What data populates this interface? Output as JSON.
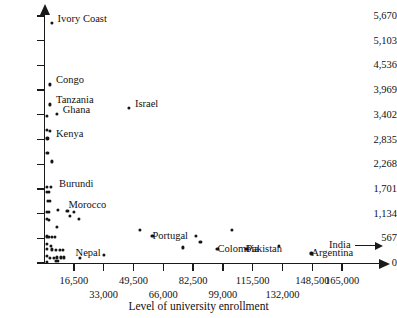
{
  "chart_data": {
    "type": "scatter",
    "title": "",
    "xlabel": "Level of university enrollment",
    "ylabel": "",
    "xlim": [
      0,
      181500
    ],
    "ylim": [
      0,
      5670
    ],
    "grid": false,
    "legend": null,
    "x_ticks": [
      {
        "value": 16500,
        "label": "16,500",
        "row": "a"
      },
      {
        "value": 33000,
        "label": "33,000",
        "row": "b"
      },
      {
        "value": 49500,
        "label": "49,500",
        "row": "a"
      },
      {
        "value": 66000,
        "label": "66,000",
        "row": "b"
      },
      {
        "value": 82500,
        "label": "82,500",
        "row": "a"
      },
      {
        "value": 99000,
        "label": "99,000",
        "row": "b"
      },
      {
        "value": 115500,
        "label": "115,500",
        "row": "a"
      },
      {
        "value": 132000,
        "label": "132,000",
        "row": "b"
      },
      {
        "value": 148500,
        "label": "148,500",
        "row": "a"
      },
      {
        "value": 165000,
        "label": "165,000",
        "row": "a"
      }
    ],
    "y_ticks": [
      {
        "value": 0,
        "label": "0"
      },
      {
        "value": 567,
        "label": "567"
      },
      {
        "value": 1134,
        "label": "1,134"
      },
      {
        "value": 1701,
        "label": "1,701"
      },
      {
        "value": 2268,
        "label": "2,268"
      },
      {
        "value": 2835,
        "label": "2,835"
      },
      {
        "value": 3402,
        "label": "3,402"
      },
      {
        "value": 3969,
        "label": "3,969"
      },
      {
        "value": 4536,
        "label": "4,536"
      },
      {
        "value": 5103,
        "label": "5,103"
      },
      {
        "value": 5670,
        "label": "5,670"
      }
    ],
    "annotations": [
      {
        "name": "india-offscale",
        "label": "India",
        "note": "arrow pointing right, value beyond axis range"
      }
    ],
    "labeled_points": [
      {
        "label": "Ivory Coast",
        "x": 4200,
        "y": 5510,
        "label_dx": 6,
        "label_dy": -4
      },
      {
        "label": "Congo",
        "x": 3300,
        "y": 4100,
        "label_dx": 6,
        "label_dy": -4
      },
      {
        "label": "Tanzania",
        "x": 3300,
        "y": 3640,
        "label_dx": 6,
        "label_dy": -4
      },
      {
        "label": "Israel",
        "x": 47000,
        "y": 3560,
        "label_dx": 6,
        "label_dy": -4
      },
      {
        "label": "Ghana",
        "x": 7000,
        "y": 3420,
        "label_dx": 6,
        "label_dy": -4
      },
      {
        "label": "Kenya",
        "x": 3300,
        "y": 2860,
        "label_dx": 6,
        "label_dy": -4
      },
      {
        "label": "Burundi",
        "x": 3300,
        "y": 1720,
        "label_dx": 9,
        "label_dy": -4
      },
      {
        "label": "Morocco",
        "x": 13500,
        "y": 1320,
        "label_dx": 0,
        "label_dy": 0
      },
      {
        "label": "Portugal",
        "x": 60000,
        "y": 620,
        "label_dx": 0,
        "label_dy": 0
      },
      {
        "label": "Colombia",
        "x": 96000,
        "y": 330,
        "label_dx": 0,
        "label_dy": 0
      },
      {
        "label": "Nepal",
        "x": 12500,
        "y": 150,
        "label_dx": 9,
        "label_dy": -3
      },
      {
        "label": "Pakistan",
        "x": 112000,
        "y": 330,
        "label_dx": 0,
        "label_dy": 0
      },
      {
        "label": "Argentina",
        "x": 148000,
        "y": 220,
        "label_dx": 0,
        "label_dy": 0
      }
    ],
    "points": [
      {
        "x": 4200,
        "y": 5510
      },
      {
        "x": 3300,
        "y": 4100
      },
      {
        "x": 3300,
        "y": 3640
      },
      {
        "x": 7000,
        "y": 3420
      },
      {
        "x": 47000,
        "y": 3560
      },
      {
        "x": 1800,
        "y": 3380
      },
      {
        "x": 1800,
        "y": 3060
      },
      {
        "x": 3400,
        "y": 3030
      },
      {
        "x": 1900,
        "y": 2860
      },
      {
        "x": 1900,
        "y": 2530
      },
      {
        "x": 4200,
        "y": 2330
      },
      {
        "x": 1700,
        "y": 1740
      },
      {
        "x": 3600,
        "y": 1740
      },
      {
        "x": 1500,
        "y": 1640
      },
      {
        "x": 2600,
        "y": 1630
      },
      {
        "x": 2000,
        "y": 1430
      },
      {
        "x": 3400,
        "y": 1430
      },
      {
        "x": 1500,
        "y": 1170
      },
      {
        "x": 2700,
        "y": 1170
      },
      {
        "x": 7500,
        "y": 1210
      },
      {
        "x": 13000,
        "y": 1190
      },
      {
        "x": 16500,
        "y": 1170
      },
      {
        "x": 14500,
        "y": 1090
      },
      {
        "x": 19500,
        "y": 1020
      },
      {
        "x": 1500,
        "y": 1020
      },
      {
        "x": 2500,
        "y": 980
      },
      {
        "x": 7300,
        "y": 830
      },
      {
        "x": 1500,
        "y": 610
      },
      {
        "x": 2700,
        "y": 600
      },
      {
        "x": 4200,
        "y": 600
      },
      {
        "x": 6200,
        "y": 600
      },
      {
        "x": 53000,
        "y": 760
      },
      {
        "x": 1600,
        "y": 440
      },
      {
        "x": 3600,
        "y": 400
      },
      {
        "x": 1600,
        "y": 330
      },
      {
        "x": 4300,
        "y": 310
      },
      {
        "x": 6500,
        "y": 300
      },
      {
        "x": 8600,
        "y": 300
      },
      {
        "x": 10500,
        "y": 300
      },
      {
        "x": 60000,
        "y": 620
      },
      {
        "x": 84000,
        "y": 620
      },
      {
        "x": 86500,
        "y": 480
      },
      {
        "x": 77000,
        "y": 360
      },
      {
        "x": 104000,
        "y": 760
      },
      {
        "x": 96000,
        "y": 330
      },
      {
        "x": 1600,
        "y": 160
      },
      {
        "x": 3200,
        "y": 120
      },
      {
        "x": 5300,
        "y": 120
      },
      {
        "x": 7200,
        "y": 130
      },
      {
        "x": 9300,
        "y": 130
      },
      {
        "x": 11200,
        "y": 130
      },
      {
        "x": 20000,
        "y": 120
      },
      {
        "x": 33000,
        "y": 190
      },
      {
        "x": 112000,
        "y": 330
      },
      {
        "x": 130000,
        "y": 400
      },
      {
        "x": 148000,
        "y": 220
      },
      {
        "x": 1600,
        "y": 30
      },
      {
        "x": 6500,
        "y": 40
      },
      {
        "x": 7700,
        "y": 40
      }
    ]
  }
}
